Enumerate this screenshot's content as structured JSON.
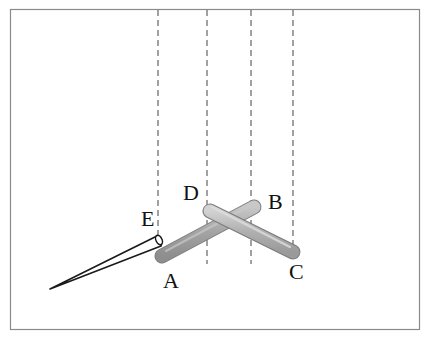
{
  "figure": {
    "frame": {
      "x": 10,
      "y": 9,
      "width": 410,
      "height": 321,
      "stroke": "#8a8a8a"
    },
    "dashed_lines": [
      {
        "id": "line-e",
        "x": 158,
        "y1": 9,
        "y2": 236
      },
      {
        "id": "line-d",
        "x": 207,
        "y1": 9,
        "y2": 264
      },
      {
        "id": "line-b",
        "x": 251,
        "y1": 9,
        "y2": 264
      },
      {
        "id": "line-c",
        "x": 293,
        "y1": 9,
        "y2": 246
      }
    ],
    "sticks": [
      {
        "id": "stick-ab",
        "from": "A",
        "to": "B",
        "color": "#a9a9a9"
      },
      {
        "id": "stick-dc",
        "from": "D",
        "to": "C",
        "color": "#b3b3b3"
      }
    ],
    "needle": {
      "id": "needle-e",
      "tip": "E"
    },
    "labels": {
      "A": "A",
      "B": "B",
      "C": "C",
      "D": "D",
      "E": "E"
    }
  }
}
